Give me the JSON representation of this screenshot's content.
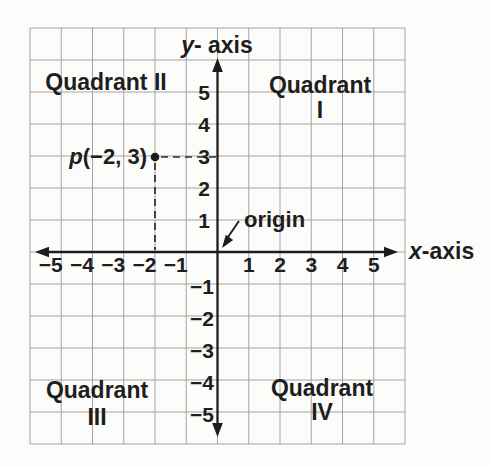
{
  "figure": {
    "title_semantics": "Cartesian coordinate plane with labeled quadrants, axes, origin and plotted point",
    "y_axis_label": {
      "var": "y",
      "suffix": "- axis"
    },
    "x_axis_label": {
      "var": "x",
      "suffix": "-axis"
    },
    "origin_label": "origin",
    "point_label": {
      "var": "p",
      "coords": "(−2, 3)"
    },
    "point": {
      "x": -2,
      "y": 3
    },
    "quadrants": {
      "q1": {
        "line1": "Quadrant",
        "line2": "I"
      },
      "q2": {
        "line1": "Quadrant II"
      },
      "q3": {
        "line1": "Quadrant",
        "line2": "III"
      },
      "q4": {
        "line1": "Quadrant",
        "line2": "IV"
      }
    },
    "x_ticks_neg": [
      "−5",
      "−4",
      "−3",
      "−2",
      "−1"
    ],
    "x_ticks_pos": [
      "1",
      "2",
      "3",
      "4",
      "5"
    ],
    "y_ticks_pos": [
      "5",
      "4",
      "3",
      "2",
      "1"
    ],
    "y_ticks_neg": [
      "−1",
      "−2",
      "−3",
      "−4",
      "−5"
    ]
  },
  "chart_data": {
    "type": "scatter",
    "xlabel": "x-axis",
    "ylabel": "y-axis",
    "xlim": [
      -6,
      6
    ],
    "ylim": [
      -6,
      7
    ],
    "x_ticks": [
      -5,
      -4,
      -3,
      -2,
      -1,
      1,
      2,
      3,
      4,
      5
    ],
    "y_ticks": [
      -5,
      -4,
      -3,
      -2,
      -1,
      1,
      2,
      3,
      4,
      5
    ],
    "grid": true,
    "points": [
      {
        "label": "p",
        "x": -2,
        "y": 3
      }
    ],
    "annotations": [
      "Quadrant I",
      "Quadrant II",
      "Quadrant III",
      "Quadrant IV",
      "origin",
      "p(−2, 3)"
    ]
  },
  "colors": {
    "ink": "#1e1e1e",
    "grid_line": "#a4a4a4",
    "paper": "#fcfcfa"
  }
}
